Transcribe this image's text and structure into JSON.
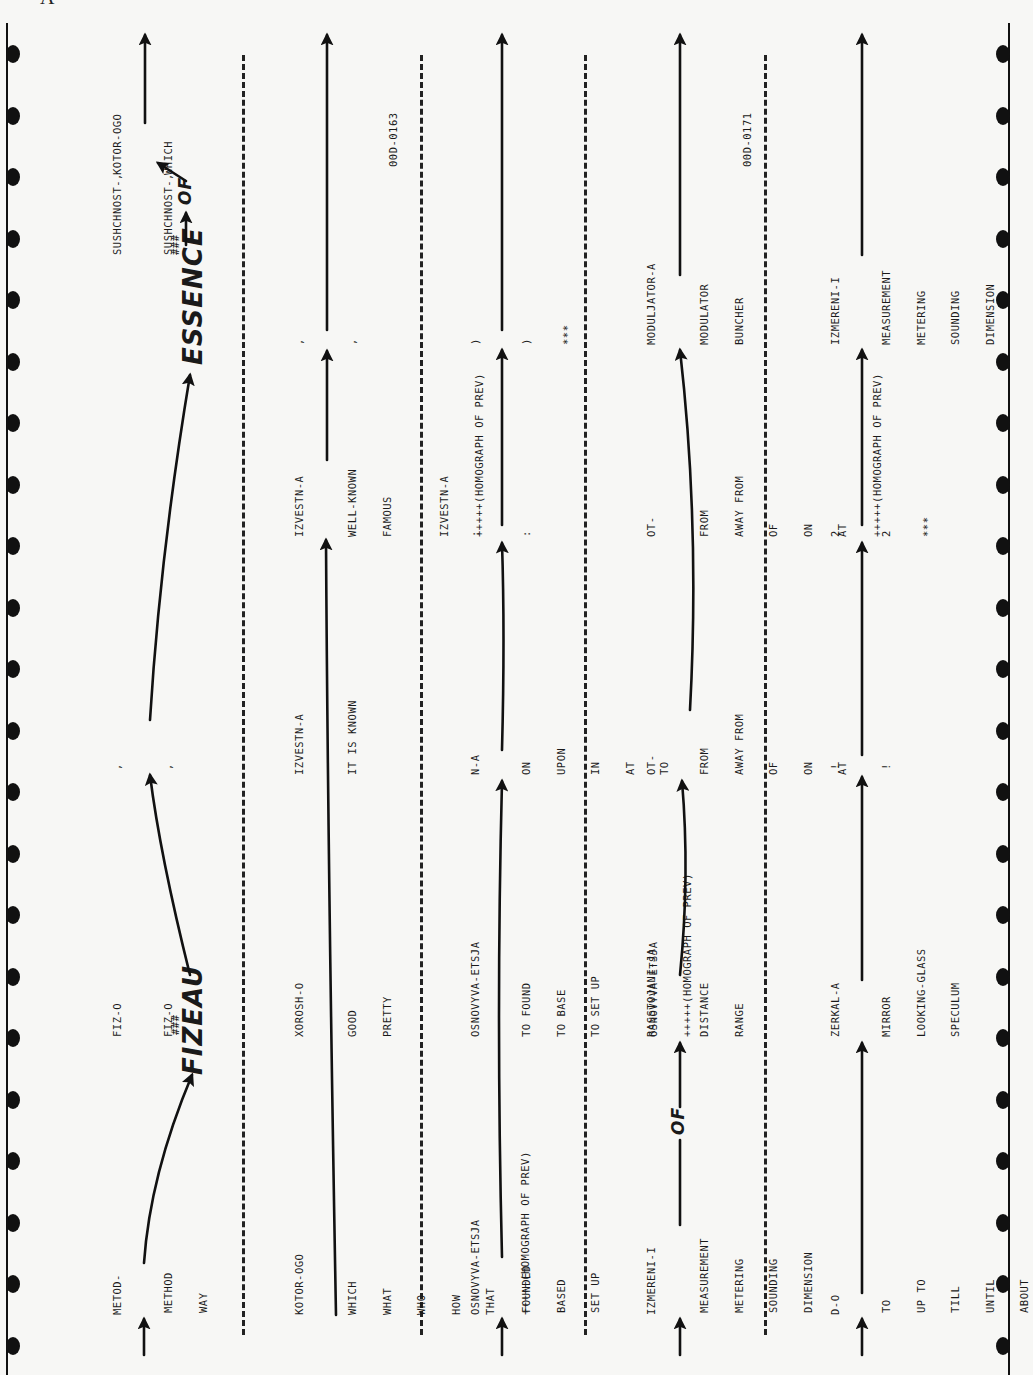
{
  "page_label": "A",
  "rows": [
    {
      "id": "row-1",
      "source": [
        "METOD-",
        "FIZ-O",
        ",",
        "SUSHCHNOST-,",
        "KOTOR-OGO"
      ],
      "translation_lines": [
        [
          "METHOD",
          "WAY"
        ],
        [
          "FIZ-O"
        ],
        [
          ","
        ],
        [
          "SUSHCHNOST-,"
        ],
        [
          "WHICH"
        ]
      ],
      "annotations": {
        "hash1": "###",
        "hand1": "FIZEAU",
        "hash2": "###",
        "hand2": "ESSENCE",
        "hand3": "OF"
      }
    },
    {
      "id": "row-2",
      "source": [
        "KOTOR-OGO",
        "XOROSH-O",
        "IZVESTN-A",
        "IZVESTN-A",
        ","
      ],
      "translation_lines": [
        [
          "WHICH",
          "WHAT",
          "WHO",
          "HOW",
          "THAT",
          "+++++(HOMOGRAPH OF PREV)"
        ],
        [
          "GOOD",
          "PRETTY"
        ],
        [
          "IT IS KNOWN"
        ],
        [
          "WELL-KNOWN",
          "FAMOUS",
          "",
          "IZVESTN-A",
          "+++++(HOMOGRAPH OF PREV)"
        ],
        [
          ","
        ]
      ],
      "ref": "00D-0163"
    },
    {
      "id": "row-3",
      "source": [
        "OSNOVYVA-ETSJA",
        "OSNOVYVA-ETSJA",
        "N-A",
        ":",
        ")"
      ],
      "translation_lines": [
        [
          "FOUNDED",
          "BASED",
          "SET UP"
        ],
        [
          "TO FOUND",
          "TO BASE",
          "TO SET UP",
          "",
          "OSNOVYVA-ETSJA",
          "+++++(HOMOGRAPH OF PREV)"
        ],
        [
          "ON",
          "UPON",
          "IN",
          "AT",
          "TO"
        ],
        [
          ":"
        ],
        [
          ")",
          "***"
        ]
      ]
    },
    {
      "id": "row-4",
      "source": [
        "IZMERENI-I",
        "RASSTOJANI-JA",
        "OT-",
        "OT-",
        "MODULJATOR-A"
      ],
      "translation_lines": [
        [
          "MEASUREMENT",
          "METERING",
          "SOUNDING",
          "DIMENSION"
        ],
        [
          "DISTANCE",
          "RANGE"
        ],
        [
          "FROM",
          "AWAY FROM",
          "OF",
          "ON",
          "AT"
        ],
        [
          "FROM",
          "AWAY FROM",
          "OF",
          "ON",
          "AT",
          "+++++(HOMOGRAPH OF PREV)"
        ],
        [
          "MODULATOR",
          "BUNCHER"
        ]
      ],
      "annotations": {
        "hand1": "OF"
      },
      "ref": "00D-0171"
    },
    {
      "id": "row-5",
      "source": [
        "D-O",
        "ZERKAL-A",
        "!",
        "2",
        "IZMERENI-I"
      ],
      "translation_lines": [
        [
          "TO",
          "UP TO",
          "TILL",
          "UNTIL",
          "ABOUT"
        ],
        [
          "MIRROR",
          "LOOKING-GLASS",
          "SPECULUM"
        ],
        [
          "!"
        ],
        [
          "2",
          "***"
        ],
        [
          "MEASUREMENT",
          "METERING",
          "SOUNDING",
          "DIMENSION"
        ]
      ]
    }
  ]
}
